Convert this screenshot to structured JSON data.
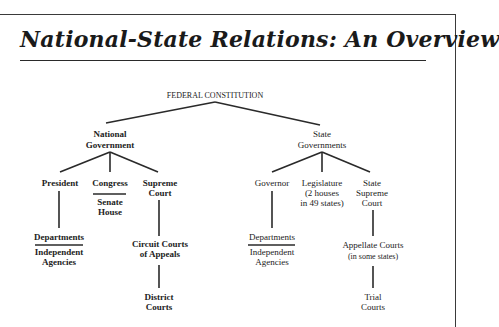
{
  "title": "National-State Relations: An Overview",
  "root": {
    "label": "FEDERAL CONSTITUTION"
  },
  "national": {
    "label_line1": "National",
    "label_line2": "Government",
    "president": {
      "label": "President",
      "child_top": "Departments",
      "child_bottom_line1": "Independent",
      "child_bottom_line2": "Agencies"
    },
    "congress": {
      "label": "Congress",
      "child_line1": "Senate",
      "child_line2": "House"
    },
    "supreme_court": {
      "label_line1": "Supreme",
      "label_line2": "Court",
      "circuit_line1": "Circuit Courts",
      "circuit_line2": "of Appeals",
      "district_line1": "District",
      "district_line2": "Courts"
    }
  },
  "state": {
    "label_line1": "State",
    "label_line2": "Governments",
    "governor": {
      "label": "Governor",
      "child_top": "Departments",
      "child_bottom_line1": "Independent",
      "child_bottom_line2": "Agencies"
    },
    "legislature": {
      "label_line1": "Legislature",
      "label_line2": "(2 houses",
      "label_line3": "in 49 states)"
    },
    "state_supreme_court": {
      "label_line1": "State",
      "label_line2": "Supreme",
      "label_line3": "Court",
      "appellate_line1": "Appellate Courts",
      "appellate_line2": "(in some states)",
      "trial_line1": "Trial",
      "trial_line2": "Courts"
    }
  }
}
